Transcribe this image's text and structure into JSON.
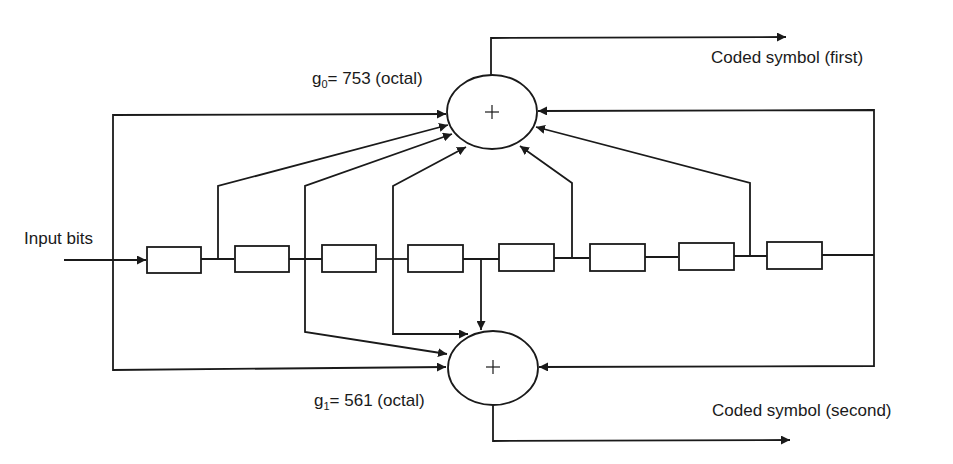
{
  "diagram": {
    "type": "convolutional-encoder",
    "input_label": "Input bits",
    "generators": [
      {
        "name": "g",
        "sub": "0",
        "equals": "= 753 (octal)",
        "output_label": "Coded symbol (first)"
      },
      {
        "name": "g",
        "sub": "1",
        "equals": "= 561 (octal)",
        "output_label": "Coded symbol (second)"
      }
    ],
    "adder_symbol": "+",
    "shift_register_count": 8,
    "colors": {
      "stroke": "#1a1a1a",
      "background": "#ffffff"
    }
  }
}
